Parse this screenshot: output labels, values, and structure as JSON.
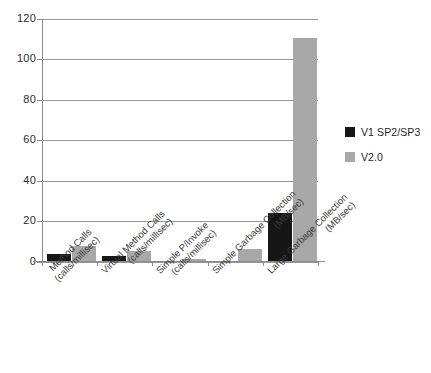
{
  "chart_data": {
    "type": "bar",
    "title": "",
    "xlabel": "",
    "ylabel": "",
    "ylim": [
      0,
      120
    ],
    "ytick_step": 20,
    "yticks": [
      "0",
      "20",
      "40",
      "60",
      "80",
      "100",
      "120"
    ],
    "grid": true,
    "legend_position": "right",
    "categories": [
      "Method Calls (calls/millisec)",
      "Virtual Method Calls (calls/millisec)",
      "Simple P/Invoke (calls/millisec)",
      "Simple Garbage Collection (MB/sec)",
      "Large Garbage Collection (MB/sec)"
    ],
    "category_lines": [
      {
        "line1": "Method Calls",
        "line2": "(calls/millisec)"
      },
      {
        "line1": "Virtual Method Calls",
        "line2": "(calls/millisec)"
      },
      {
        "line1": "Simple P/Invoke",
        "line2": "(calls/millisec)"
      },
      {
        "line1": "Simple Garbage Collection",
        "line2": "(MB/sec)"
      },
      {
        "line1": "Large Garbage Collection",
        "line2": "(MB/sec)"
      }
    ],
    "series": [
      {
        "name": "V1 SP2/SP3",
        "color": "#161616",
        "values": [
          4,
          3,
          0.7,
          0.7,
          24.5
        ]
      },
      {
        "name": "V2.0",
        "color": "#a8a8a8",
        "values": [
          7.8,
          5.5,
          1.5,
          6.2,
          111
        ]
      }
    ]
  },
  "legend": {
    "items": [
      {
        "label": "V1 SP2/SP3",
        "color": "#161616"
      },
      {
        "label": "V2.0",
        "color": "#a8a8a8"
      }
    ]
  }
}
